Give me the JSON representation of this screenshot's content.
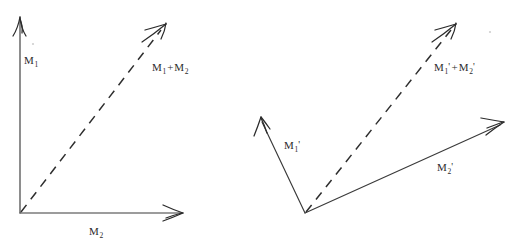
{
  "figure": {
    "background_color": "#ffffff",
    "stroke_color": "#2e2e2e",
    "width": 507,
    "height": 240,
    "panels": [
      {
        "id": "left",
        "name": "axis-vector-sum",
        "style": "coordinate-axes",
        "origin": [
          20,
          213
        ],
        "vectors": [
          {
            "name": "m1-axis",
            "label": "M",
            "subscript": "1",
            "prime": "",
            "style": "solid",
            "from": [
              20,
              213
            ],
            "to": [
              20,
              18
            ],
            "label_pos": [
              24,
              55
            ]
          },
          {
            "name": "m2-axis",
            "label": "M",
            "subscript": "2",
            "prime": "",
            "style": "solid",
            "from": [
              20,
              213
            ],
            "to": [
              183,
              213
            ],
            "label_pos": [
              89,
              226
            ]
          },
          {
            "name": "m1-plus-m2-resultant",
            "label": "M",
            "subscript": "1",
            "prime": "",
            "label2": "M",
            "subscript2": "2",
            "prime2": "",
            "operator": "+",
            "style": "dashed",
            "from": [
              20,
              213
            ],
            "to": [
              165,
              25
            ],
            "label_pos": [
              152,
              62
            ]
          }
        ]
      },
      {
        "id": "right",
        "name": "free-vector-sum",
        "style": "free-vectors",
        "origin": [
          305,
          213
        ],
        "vectors": [
          {
            "name": "m1-prime",
            "label": "M",
            "subscript": "1",
            "prime": "'",
            "style": "solid",
            "from": [
              305,
              213
            ],
            "to": [
              261,
              118
            ],
            "label_pos": [
              284,
              140
            ]
          },
          {
            "name": "m2-prime",
            "label": "M",
            "subscript": "2",
            "prime": "'",
            "style": "solid",
            "from": [
              305,
              213
            ],
            "to": [
              503,
              123
            ],
            "label_pos": [
              437,
              162
            ]
          },
          {
            "name": "m1-prime-plus-m2-prime-resultant",
            "label": "M",
            "subscript": "1",
            "prime": "'",
            "label2": "M",
            "subscript2": "2",
            "prime2": "'",
            "operator": "+",
            "style": "dashed",
            "from": [
              305,
              213
            ],
            "to": [
              455,
              25
            ],
            "label_pos": [
              434,
              62
            ]
          }
        ]
      }
    ],
    "labels": {
      "left_m1": "M",
      "left_m1_sub": "1",
      "left_m2": "M",
      "left_m2_sub": "2",
      "left_sum_a": "M",
      "left_sum_a_sub": "1",
      "left_sum_op": "+",
      "left_sum_b": "M",
      "left_sum_b_sub": "2",
      "right_m1": "M",
      "right_m1_sub": "1",
      "right_m1_prime": "'",
      "right_m2": "M",
      "right_m2_sub": "2",
      "right_m2_prime": "'",
      "right_sum_a": "M",
      "right_sum_a_sub": "1",
      "right_sum_a_prime": "'",
      "right_sum_op": "+",
      "right_sum_b": "M",
      "right_sum_b_sub": "2",
      "right_sum_b_prime": "'"
    }
  }
}
